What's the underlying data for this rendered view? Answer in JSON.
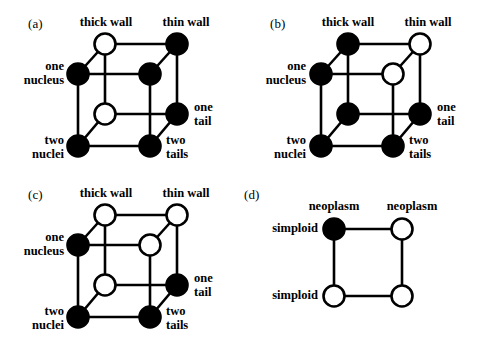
{
  "figure": {
    "background": "#ffffff",
    "ink": "#000000",
    "node_fill_black": "#000000",
    "node_fill_white": "#ffffff"
  },
  "panels": [
    {
      "tag": "(a)",
      "type": "cube",
      "labels": {
        "top_left": "thick wall",
        "top_right": "thin wall",
        "left_upper_line1": "one",
        "left_upper_line2": "nucleus",
        "left_lower_line1": "two",
        "left_lower_line2": "nuclei",
        "right_upper_line1": "one",
        "right_upper_line2": "tail",
        "right_lower_line1": "two",
        "right_lower_line2": "tails"
      },
      "nodes": [
        {
          "id": "back-top-left",
          "fill": "white"
        },
        {
          "id": "back-top-right",
          "fill": "black"
        },
        {
          "id": "back-bottom-left",
          "fill": "white"
        },
        {
          "id": "back-bottom-right",
          "fill": "black"
        },
        {
          "id": "front-top-left",
          "fill": "black"
        },
        {
          "id": "front-top-right",
          "fill": "black"
        },
        {
          "id": "front-bottom-left",
          "fill": "black"
        },
        {
          "id": "front-bottom-right",
          "fill": "black"
        }
      ]
    },
    {
      "tag": "(b)",
      "type": "cube",
      "labels": {
        "top_left": "thick wall",
        "top_right": "thin wall",
        "left_upper_line1": "one",
        "left_upper_line2": "nucleus",
        "left_lower_line1": "two",
        "left_lower_line2": "nuclei",
        "right_upper_line1": "one",
        "right_upper_line2": "tail",
        "right_lower_line1": "two",
        "right_lower_line2": "tails"
      },
      "nodes": [
        {
          "id": "back-top-left",
          "fill": "black"
        },
        {
          "id": "back-top-right",
          "fill": "white"
        },
        {
          "id": "back-bottom-left",
          "fill": "black"
        },
        {
          "id": "back-bottom-right",
          "fill": "black"
        },
        {
          "id": "front-top-left",
          "fill": "black"
        },
        {
          "id": "front-top-right",
          "fill": "white"
        },
        {
          "id": "front-bottom-left",
          "fill": "black"
        },
        {
          "id": "front-bottom-right",
          "fill": "black"
        }
      ]
    },
    {
      "tag": "(c)",
      "type": "cube",
      "labels": {
        "top_left": "thick wall",
        "top_right": "thin wall",
        "left_upper_line1": "one",
        "left_upper_line2": "nucleus",
        "left_lower_line1": "two",
        "left_lower_line2": "nuclei",
        "right_upper_line1": "one",
        "right_upper_line2": "tail",
        "right_lower_line1": "two",
        "right_lower_line2": "tails"
      },
      "nodes": [
        {
          "id": "back-top-left",
          "fill": "white"
        },
        {
          "id": "back-top-right",
          "fill": "white"
        },
        {
          "id": "back-bottom-left",
          "fill": "white"
        },
        {
          "id": "back-bottom-right",
          "fill": "black"
        },
        {
          "id": "front-top-left",
          "fill": "black"
        },
        {
          "id": "front-top-right",
          "fill": "white"
        },
        {
          "id": "front-bottom-left",
          "fill": "black"
        },
        {
          "id": "front-bottom-right",
          "fill": "black"
        }
      ]
    },
    {
      "tag": "(d)",
      "type": "square",
      "labels": {
        "top_left": "neoplasm",
        "top_right": "neoplasm",
        "left_upper": "simploid",
        "left_lower": "simploid"
      },
      "nodes": [
        {
          "id": "top-left",
          "fill": "black"
        },
        {
          "id": "top-right",
          "fill": "white"
        },
        {
          "id": "bottom-left",
          "fill": "white"
        },
        {
          "id": "bottom-right",
          "fill": "white"
        }
      ]
    }
  ]
}
